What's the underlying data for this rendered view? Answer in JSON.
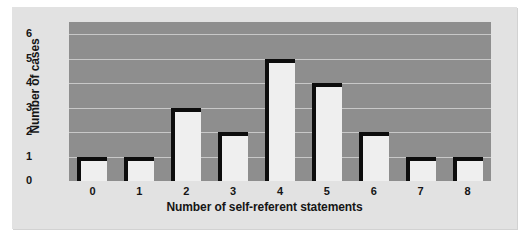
{
  "chart_data": {
    "type": "bar",
    "title": "",
    "xlabel": "Number of self-referent statements",
    "ylabel": "Number of cases",
    "categories": [
      "0",
      "1",
      "2",
      "3",
      "4",
      "5",
      "6",
      "7",
      "8"
    ],
    "values": [
      1,
      1,
      3,
      2,
      5,
      4,
      2,
      1,
      1
    ],
    "yticks": [
      "6",
      "5",
      "4",
      "3",
      "2",
      "1",
      "0"
    ],
    "ylim": [
      0,
      6.5
    ],
    "grid": true,
    "legend": "none",
    "colors": {
      "figure_background": "#e2e2e2",
      "plot_background": "#8e8e8e",
      "bar_fill": "#efefef",
      "bar_edge": "#0d0d0d",
      "gridline": "#c8c8c8",
      "text": "#151515"
    }
  }
}
